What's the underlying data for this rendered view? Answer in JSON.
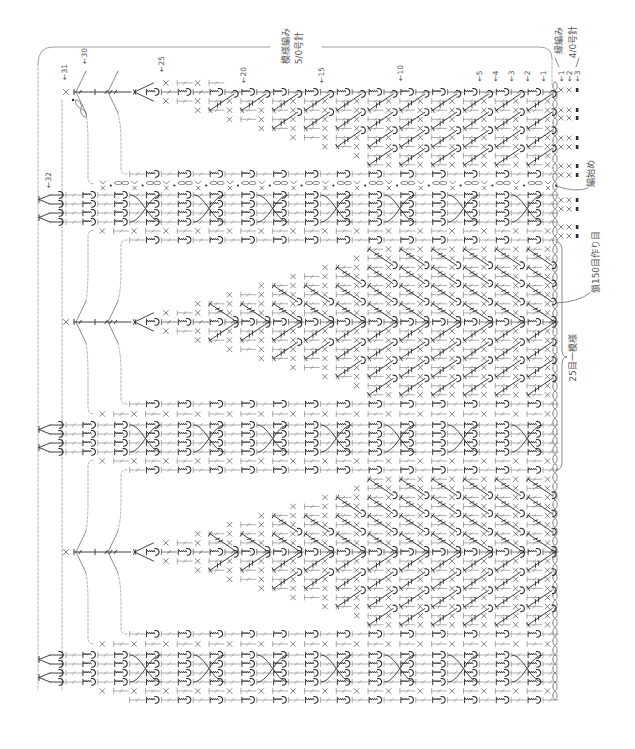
{
  "headers": {
    "pattern_stitch": "模様編み",
    "pattern_needle": "5/0号針",
    "edging_stitch": "縁編み",
    "edging_needle": "4/0号針"
  },
  "annotations": {
    "start_of_work": "編始め",
    "foundation_chain": "鎖150目作り目",
    "pattern_repeat": "25目一模様"
  },
  "row_labels": [
    {
      "row": 1,
      "text": "←1"
    },
    {
      "row": 2,
      "text": "←2"
    },
    {
      "row": 3,
      "text": "←3"
    },
    {
      "row": 4,
      "text": "←4"
    },
    {
      "row": 5,
      "text": "←5"
    },
    {
      "row": 10,
      "text": "←10"
    },
    {
      "row": 15,
      "text": "←15"
    },
    {
      "row": 20,
      "text": "←20"
    },
    {
      "row": 25,
      "text": "←25"
    },
    {
      "row": 30,
      "text": "←30"
    },
    {
      "row": 31,
      "text": "←31"
    },
    {
      "row": 32,
      "text": "←32"
    }
  ],
  "edging_row_labels": [
    {
      "row": 1,
      "text": "←1"
    },
    {
      "row": 2,
      "text": "←2"
    },
    {
      "row": 3,
      "text": "←3"
    }
  ],
  "chart": {
    "pattern_rows": 32,
    "edging_rows": 3,
    "foundation_chains": 150,
    "stitches_per_repeat": 25,
    "fan_motifs": 3,
    "cable_panels": 3,
    "fan_full_width_rows": [
      1,
      12
    ],
    "fan_apex_row": 27,
    "cable_cross_rows": [
      2,
      6,
      10,
      14,
      18,
      22,
      26
    ],
    "symbols": [
      "chain",
      "slip-stitch",
      "single-crochet",
      "double-crochet",
      "treble-crochet",
      "puff-stitch",
      "crossed-cable"
    ],
    "colors": {
      "ink": "#2a2a2a",
      "mid": "#5a5a5a",
      "light": "#8c8c8c",
      "dashed": "#a0a0a0",
      "frame": "#8a8a8a",
      "text": "#555555"
    }
  }
}
